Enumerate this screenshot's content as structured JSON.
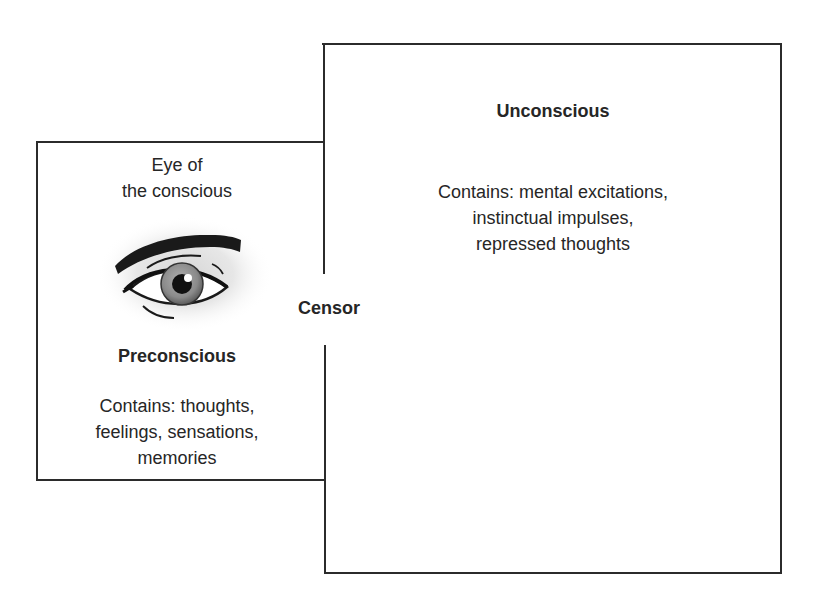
{
  "diagram": {
    "type": "Freud's model of the mind (topographic)",
    "unconscious": {
      "title": "Unconscious",
      "contents_lines": [
        "Contains: mental excitations,",
        "instinctual impulses,",
        "repressed thoughts"
      ]
    },
    "preconscious": {
      "eye_label_lines": [
        "Eye of",
        "the conscious"
      ],
      "title": "Preconscious",
      "contents_lines": [
        "Contains: thoughts,",
        "feelings, sensations,",
        "memories"
      ]
    },
    "boundary": {
      "label": "Censor"
    },
    "icons": {
      "eye": "eye-icon"
    },
    "colors": {
      "stroke": "#2b2b2b",
      "text": "#262626",
      "iris": "#8a8a8a",
      "background": "#ffffff"
    }
  }
}
